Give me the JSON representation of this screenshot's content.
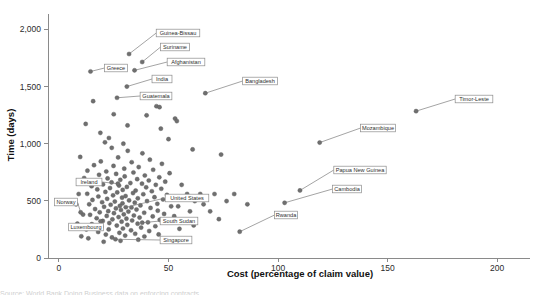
{
  "figure": {
    "caption_partial": "Source: World Bank Doing Business data on enforcing contracts"
  },
  "chart_data": {
    "type": "scatter",
    "title": "",
    "xlabel": "Cost (percentage of claim value)",
    "ylabel": "Time (days)",
    "xlim": [
      -5,
      215
    ],
    "ylim": [
      0,
      2100
    ],
    "xticks": [
      0,
      50,
      100,
      150,
      200
    ],
    "xticklabels": [
      "0",
      "50",
      "100",
      "150",
      "200"
    ],
    "yticks": [
      0,
      500,
      1000,
      1500,
      2000
    ],
    "yticklabels": [
      "0",
      "500",
      "1,000",
      "1,500",
      "2,000"
    ],
    "grid": false,
    "legend": null,
    "marker": {
      "color": "#6f6f6f",
      "size": 2.1,
      "shape": "circle"
    },
    "labeled_points": [
      {
        "name": "Guinea-Bissau",
        "x": 32.0,
        "y": 1785,
        "lbl_x": 178,
        "lbl_y": 33
      },
      {
        "name": "Suriname",
        "x": 38.0,
        "y": 1715,
        "lbl_x": 175,
        "lbl_y": 47
      },
      {
        "name": "Afghanistan",
        "x": 34.5,
        "y": 1642,
        "lbl_x": 186,
        "lbl_y": 62
      },
      {
        "name": "Greece",
        "x": 14.4,
        "y": 1632,
        "lbl_x": 116,
        "lbl_y": 68
      },
      {
        "name": "India",
        "x": 31.0,
        "y": 1500,
        "lbl_x": 162,
        "lbl_y": 79
      },
      {
        "name": "Bangladesh",
        "x": 66.8,
        "y": 1442,
        "lbl_x": 260,
        "lbl_y": 81
      },
      {
        "name": "Timor-Leste",
        "x": 163.0,
        "y": 1285,
        "lbl_x": 474,
        "lbl_y": 99
      },
      {
        "name": "Guatemala",
        "x": 26.5,
        "y": 1402,
        "lbl_x": 156,
        "lbl_y": 96
      },
      {
        "name": "Mozambique",
        "x": 119.0,
        "y": 1010,
        "lbl_x": 378,
        "lbl_y": 128
      },
      {
        "name": "Papua New Guinea",
        "x": 110.0,
        "y": 591,
        "lbl_x": 360,
        "lbl_y": 170
      },
      {
        "name": "Cambodia",
        "x": 103.0,
        "y": 483,
        "lbl_x": 347,
        "lbl_y": 189
      },
      {
        "name": "United States",
        "x": 30.5,
        "y": 444,
        "lbl_x": 187,
        "lbl_y": 198
      },
      {
        "name": "Ireland",
        "x": 26.9,
        "y": 650,
        "lbl_x": 89,
        "lbl_y": 182
      },
      {
        "name": "Norway",
        "x": 9.9,
        "y": 400,
        "lbl_x": 66,
        "lbl_y": 202
      },
      {
        "name": "South Sudan",
        "x": 38.0,
        "y": 309,
        "lbl_x": 179,
        "lbl_y": 221
      },
      {
        "name": "Rwanda",
        "x": 82.5,
        "y": 230,
        "lbl_x": 286,
        "lbl_y": 215
      },
      {
        "name": "Luxembourg",
        "x": 19.0,
        "y": 321,
        "lbl_x": 86,
        "lbl_y": 227
      },
      {
        "name": "Singapore",
        "x": 25.8,
        "y": 164,
        "lbl_x": 176,
        "lbl_y": 240
      }
    ],
    "unlabeled_points": [
      {
        "x": 15.6,
        "y": 1372
      },
      {
        "x": 44.5,
        "y": 1328
      },
      {
        "x": 45.9,
        "y": 1320
      },
      {
        "x": 53.0,
        "y": 1220
      },
      {
        "x": 53.8,
        "y": 1198
      },
      {
        "x": 12.2,
        "y": 1173
      },
      {
        "x": 31.3,
        "y": 1160
      },
      {
        "x": 18.9,
        "y": 1095
      },
      {
        "x": 22.8,
        "y": 1050
      },
      {
        "x": 21.0,
        "y": 1012
      },
      {
        "x": 29.4,
        "y": 1000
      },
      {
        "x": 24.1,
        "y": 964
      },
      {
        "x": 61.0,
        "y": 950
      },
      {
        "x": 31.4,
        "y": 938
      },
      {
        "x": 38.1,
        "y": 916
      },
      {
        "x": 74.0,
        "y": 905
      },
      {
        "x": 9.7,
        "y": 884
      },
      {
        "x": 27.0,
        "y": 880
      },
      {
        "x": 41.5,
        "y": 860
      },
      {
        "x": 19.1,
        "y": 845
      },
      {
        "x": 33.2,
        "y": 838
      },
      {
        "x": 47.0,
        "y": 824
      },
      {
        "x": 16.0,
        "y": 812
      },
      {
        "x": 24.9,
        "y": 806
      },
      {
        "x": 36.4,
        "y": 796
      },
      {
        "x": 29.8,
        "y": 782
      },
      {
        "x": 43.0,
        "y": 772
      },
      {
        "x": 13.0,
        "y": 764
      },
      {
        "x": 21.6,
        "y": 757
      },
      {
        "x": 34.0,
        "y": 748
      },
      {
        "x": 50.5,
        "y": 742
      },
      {
        "x": 26.1,
        "y": 736
      },
      {
        "x": 18.3,
        "y": 728
      },
      {
        "x": 39.2,
        "y": 722
      },
      {
        "x": 30.0,
        "y": 714
      },
      {
        "x": 45.8,
        "y": 706
      },
      {
        "x": 11.5,
        "y": 700
      },
      {
        "x": 22.2,
        "y": 696
      },
      {
        "x": 35.7,
        "y": 690
      },
      {
        "x": 28.0,
        "y": 684
      },
      {
        "x": 41.0,
        "y": 678
      },
      {
        "x": 16.8,
        "y": 672
      },
      {
        "x": 48.5,
        "y": 668
      },
      {
        "x": 24.0,
        "y": 662
      },
      {
        "x": 32.6,
        "y": 656
      },
      {
        "x": 37.9,
        "y": 650
      },
      {
        "x": 20.1,
        "y": 644
      },
      {
        "x": 44.2,
        "y": 640
      },
      {
        "x": 27.4,
        "y": 634
      },
      {
        "x": 14.9,
        "y": 628
      },
      {
        "x": 31.0,
        "y": 622
      },
      {
        "x": 39.8,
        "y": 618
      },
      {
        "x": 23.3,
        "y": 612
      },
      {
        "x": 46.7,
        "y": 606
      },
      {
        "x": 17.5,
        "y": 600
      },
      {
        "x": 29.1,
        "y": 596
      },
      {
        "x": 35.0,
        "y": 590
      },
      {
        "x": 42.4,
        "y": 584
      },
      {
        "x": 21.2,
        "y": 578
      },
      {
        "x": 26.6,
        "y": 574
      },
      {
        "x": 33.8,
        "y": 568
      },
      {
        "x": 12.9,
        "y": 562
      },
      {
        "x": 38.5,
        "y": 558
      },
      {
        "x": 49.3,
        "y": 552
      },
      {
        "x": 24.7,
        "y": 548
      },
      {
        "x": 30.4,
        "y": 542
      },
      {
        "x": 18.0,
        "y": 538
      },
      {
        "x": 43.6,
        "y": 532
      },
      {
        "x": 28.8,
        "y": 528
      },
      {
        "x": 36.0,
        "y": 522
      },
      {
        "x": 22.0,
        "y": 518
      },
      {
        "x": 47.5,
        "y": 512
      },
      {
        "x": 15.3,
        "y": 508
      },
      {
        "x": 32.0,
        "y": 504
      },
      {
        "x": 40.2,
        "y": 498
      },
      {
        "x": 25.5,
        "y": 494
      },
      {
        "x": 19.7,
        "y": 488
      },
      {
        "x": 34.6,
        "y": 484
      },
      {
        "x": 29.0,
        "y": 478
      },
      {
        "x": 44.9,
        "y": 474
      },
      {
        "x": 13.8,
        "y": 470
      },
      {
        "x": 23.6,
        "y": 466
      },
      {
        "x": 37.2,
        "y": 460
      },
      {
        "x": 27.8,
        "y": 456
      },
      {
        "x": 51.2,
        "y": 452
      },
      {
        "x": 20.6,
        "y": 448
      },
      {
        "x": 33.1,
        "y": 442
      },
      {
        "x": 41.8,
        "y": 438
      },
      {
        "x": 26.0,
        "y": 434
      },
      {
        "x": 16.5,
        "y": 428
      },
      {
        "x": 35.4,
        "y": 424
      },
      {
        "x": 28.3,
        "y": 420
      },
      {
        "x": 45.1,
        "y": 414
      },
      {
        "x": 22.5,
        "y": 410
      },
      {
        "x": 31.7,
        "y": 406
      },
      {
        "x": 18.6,
        "y": 400
      },
      {
        "x": 38.9,
        "y": 396
      },
      {
        "x": 25.1,
        "y": 392
      },
      {
        "x": 48.0,
        "y": 386
      },
      {
        "x": 29.6,
        "y": 382
      },
      {
        "x": 14.2,
        "y": 378
      },
      {
        "x": 34.2,
        "y": 372
      },
      {
        "x": 21.8,
        "y": 368
      },
      {
        "x": 42.8,
        "y": 364
      },
      {
        "x": 27.2,
        "y": 358
      },
      {
        "x": 36.8,
        "y": 354
      },
      {
        "x": 17.2,
        "y": 348
      },
      {
        "x": 30.8,
        "y": 344
      },
      {
        "x": 24.4,
        "y": 338
      },
      {
        "x": 46.0,
        "y": 334
      },
      {
        "x": 33.4,
        "y": 328
      },
      {
        "x": 20.0,
        "y": 324
      },
      {
        "x": 28.6,
        "y": 318
      },
      {
        "x": 40.6,
        "y": 312
      },
      {
        "x": 23.0,
        "y": 306
      },
      {
        "x": 35.9,
        "y": 300
      },
      {
        "x": 15.0,
        "y": 296
      },
      {
        "x": 31.2,
        "y": 290
      },
      {
        "x": 26.4,
        "y": 284
      },
      {
        "x": 44.0,
        "y": 278
      },
      {
        "x": 19.4,
        "y": 272
      },
      {
        "x": 37.5,
        "y": 266
      },
      {
        "x": 29.2,
        "y": 258
      },
      {
        "x": 22.7,
        "y": 250
      },
      {
        "x": 32.9,
        "y": 242
      },
      {
        "x": 41.2,
        "y": 236
      },
      {
        "x": 17.9,
        "y": 228
      },
      {
        "x": 27.6,
        "y": 220
      },
      {
        "x": 34.8,
        "y": 212
      },
      {
        "x": 21.4,
        "y": 205
      },
      {
        "x": 30.2,
        "y": 196
      },
      {
        "x": 39.0,
        "y": 188
      },
      {
        "x": 24.2,
        "y": 180
      },
      {
        "x": 13.4,
        "y": 172
      },
      {
        "x": 36.2,
        "y": 160
      },
      {
        "x": 28.1,
        "y": 150
      },
      {
        "x": 20.4,
        "y": 142
      },
      {
        "x": 45.5,
        "y": 206
      },
      {
        "x": 56.0,
        "y": 640
      },
      {
        "x": 58.5,
        "y": 560
      },
      {
        "x": 62.0,
        "y": 498
      },
      {
        "x": 54.4,
        "y": 452
      },
      {
        "x": 59.8,
        "y": 408
      },
      {
        "x": 64.5,
        "y": 560
      },
      {
        "x": 52.6,
        "y": 366
      },
      {
        "x": 57.2,
        "y": 322
      },
      {
        "x": 66.0,
        "y": 470
      },
      {
        "x": 71.0,
        "y": 560
      },
      {
        "x": 76.5,
        "y": 498
      },
      {
        "x": 69.0,
        "y": 408
      },
      {
        "x": 80.0,
        "y": 560
      },
      {
        "x": 86.0,
        "y": 470
      },
      {
        "x": 61.5,
        "y": 285
      },
      {
        "x": 55.0,
        "y": 255
      },
      {
        "x": 73.0,
        "y": 340
      },
      {
        "x": 50.0,
        "y": 1040
      },
      {
        "x": 46.5,
        "y": 1132
      },
      {
        "x": 40.0,
        "y": 1248
      },
      {
        "x": 25.0,
        "y": 1258
      },
      {
        "x": 9.0,
        "y": 560
      },
      {
        "x": 7.8,
        "y": 470
      },
      {
        "x": 11.0,
        "y": 380
      },
      {
        "x": 8.4,
        "y": 300
      },
      {
        "x": 12.5,
        "y": 250
      },
      {
        "x": 10.2,
        "y": 190
      }
    ]
  }
}
